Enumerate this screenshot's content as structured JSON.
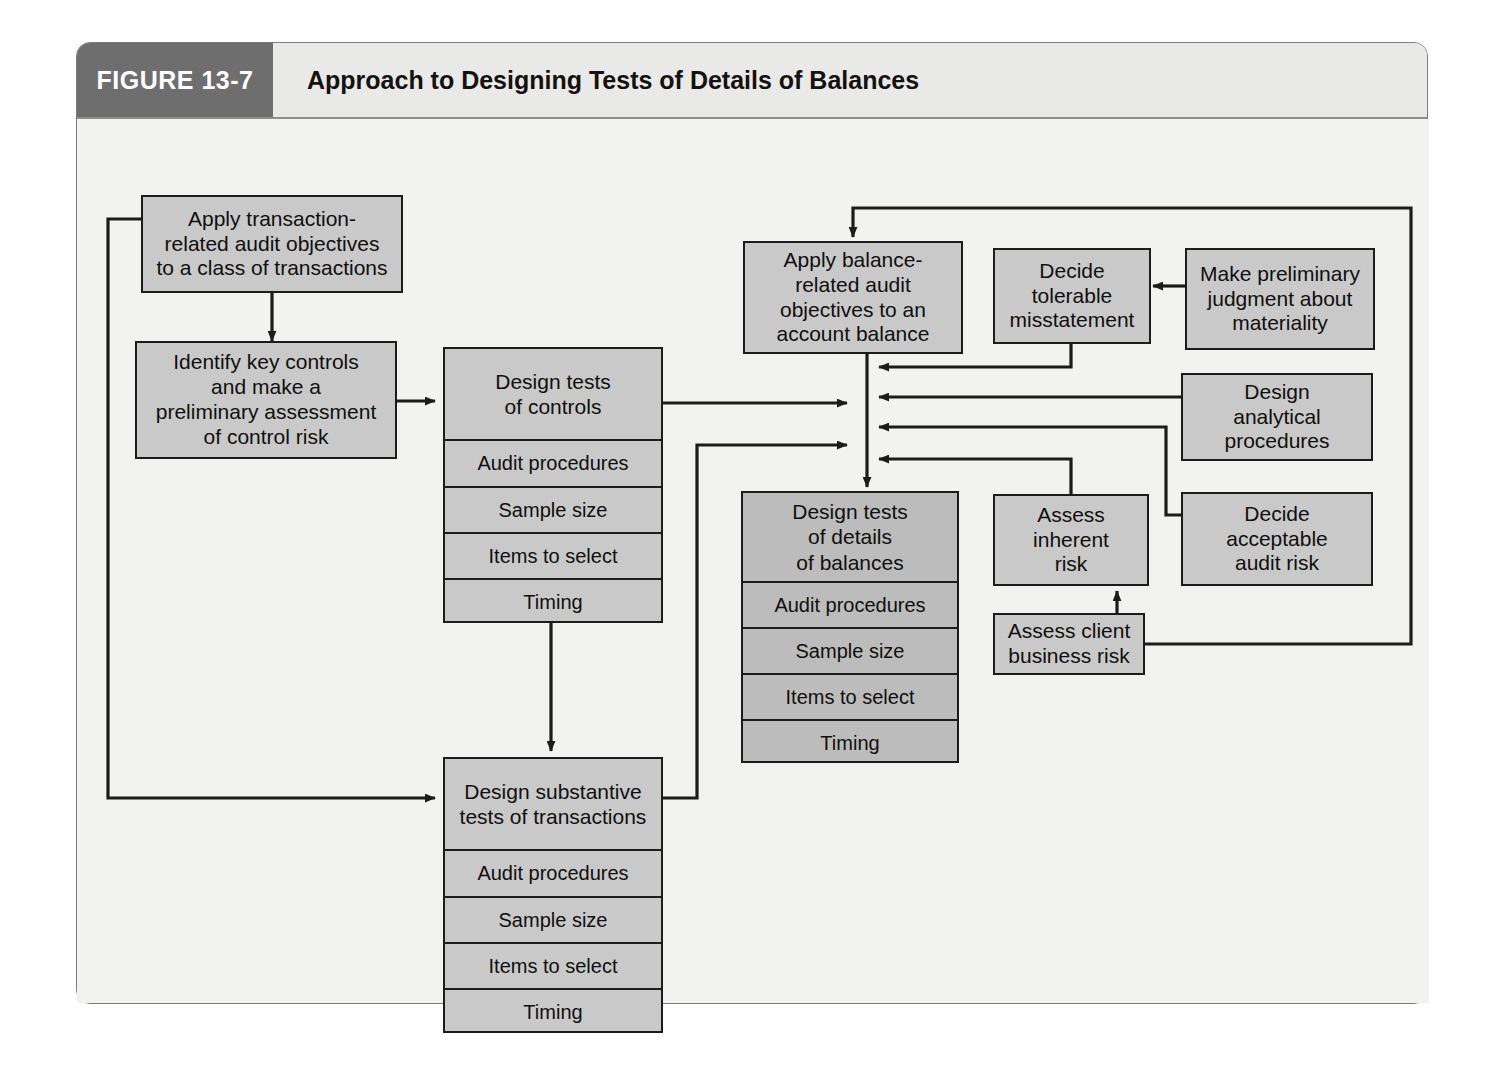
{
  "figure": {
    "tab_label": "FIGURE 13-7",
    "title": "Approach to Designing Tests of Details of Balances"
  },
  "colors": {
    "tab_bg": "#6e6e6e",
    "title_bg": "#e9e9e7",
    "canvas_bg": "#f2f2f1",
    "node_fill": "#c9c9c9",
    "node_fill_dark": "#bcbcbc",
    "stroke": "#1b1b1b"
  },
  "nodes": {
    "apply_transaction": {
      "label": "Apply transaction-\nrelated audit objectives\nto a class of transactions"
    },
    "identify_key_controls": {
      "label": "Identify key controls\nand make a\npreliminary assessment\nof control risk"
    },
    "design_tests_controls": {
      "header": "Design tests\nof controls",
      "rows": [
        "Audit procedures",
        "Sample size",
        "Items to select",
        "Timing"
      ]
    },
    "design_substantive_tests": {
      "header": "Design substantive\ntests of transactions",
      "rows": [
        "Audit procedures",
        "Sample size",
        "Items to select",
        "Timing"
      ]
    },
    "apply_balance": {
      "label": "Apply balance-\nrelated audit\nobjectives to an\naccount balance"
    },
    "design_tests_details": {
      "header": "Design tests\nof details\nof balances",
      "rows": [
        "Audit procedures",
        "Sample size",
        "Items to select",
        "Timing"
      ]
    },
    "decide_tolerable": {
      "label": "Decide\ntolerable\nmisstatement"
    },
    "make_preliminary": {
      "label": "Make preliminary\njudgment about\nmateriality"
    },
    "design_analytical": {
      "label": "Design\nanalytical\nprocedures"
    },
    "assess_inherent": {
      "label": "Assess\ninherent\nrisk"
    },
    "decide_acceptable": {
      "label": "Decide\nacceptable\naudit risk"
    },
    "assess_client": {
      "label": "Assess client\nbusiness risk"
    }
  },
  "chart_data": {
    "type": "flowchart",
    "title": "Approach to Designing Tests of Details of Balances",
    "nodes": [
      {
        "id": "apply_transaction",
        "text": "Apply transaction-related audit objectives to a class of transactions",
        "x": 140,
        "y": 152,
        "w": 262,
        "h": 98
      },
      {
        "id": "identify_key_controls",
        "text": "Identify key controls and make a preliminary assessment of control risk",
        "x": 134,
        "y": 302,
        "w": 262,
        "h": 112
      },
      {
        "id": "design_tests_controls",
        "text": "Design tests of controls",
        "x": 442,
        "y": 305,
        "w": 218,
        "h": 275,
        "rows": [
          "Audit procedures",
          "Sample size",
          "Items to select",
          "Timing"
        ]
      },
      {
        "id": "design_substantive_tests",
        "text": "Design substantive tests of transactions",
        "x": 442,
        "y": 715,
        "w": 218,
        "h": 275,
        "rows": [
          "Audit procedures",
          "Sample size",
          "Items to select",
          "Timing"
        ]
      },
      {
        "id": "apply_balance",
        "text": "Apply balance-related audit objectives to an account balance",
        "x": 742,
        "y": 198,
        "w": 220,
        "h": 113
      },
      {
        "id": "design_tests_details",
        "text": "Design tests of details of balances",
        "x": 740,
        "y": 448,
        "w": 218,
        "h": 272,
        "rows": [
          "Audit procedures",
          "Sample size",
          "Items to select",
          "Timing"
        ]
      },
      {
        "id": "decide_tolerable",
        "text": "Decide tolerable misstatement",
        "x": 992,
        "y": 205,
        "w": 158,
        "h": 96
      },
      {
        "id": "make_preliminary",
        "text": "Make preliminary judgment about materiality",
        "x": 1184,
        "y": 205,
        "w": 188,
        "h": 100
      },
      {
        "id": "design_analytical",
        "text": "Design analytical procedures",
        "x": 1180,
        "y": 330,
        "w": 192,
        "h": 88
      },
      {
        "id": "assess_inherent",
        "text": "Assess inherent risk",
        "x": 992,
        "y": 451,
        "w": 156,
        "h": 92
      },
      {
        "id": "decide_acceptable",
        "text": "Decide acceptable audit risk",
        "x": 1180,
        "y": 449,
        "w": 192,
        "h": 94
      },
      {
        "id": "assess_client",
        "text": "Assess client business risk",
        "x": 992,
        "y": 570,
        "w": 152,
        "h": 62
      }
    ],
    "edges": [
      {
        "from": "apply_transaction",
        "to": "identify_key_controls"
      },
      {
        "from": "identify_key_controls",
        "to": "design_tests_controls"
      },
      {
        "from": "design_tests_controls",
        "to": "design_substantive_tests"
      },
      {
        "from": "apply_transaction",
        "to": "design_substantive_tests"
      },
      {
        "from": "design_tests_controls",
        "to": "design_tests_details"
      },
      {
        "from": "design_substantive_tests",
        "to": "design_tests_details"
      },
      {
        "from": "apply_balance",
        "to": "design_tests_details"
      },
      {
        "from": "make_preliminary",
        "to": "decide_tolerable"
      },
      {
        "from": "decide_tolerable",
        "to": "design_tests_details"
      },
      {
        "from": "design_analytical",
        "to": "design_tests_details"
      },
      {
        "from": "decide_acceptable",
        "to": "design_tests_details"
      },
      {
        "from": "assess_inherent",
        "to": "design_tests_details"
      },
      {
        "from": "assess_client",
        "to": "assess_inherent"
      },
      {
        "from": "assess_client",
        "to": "apply_balance"
      }
    ]
  }
}
